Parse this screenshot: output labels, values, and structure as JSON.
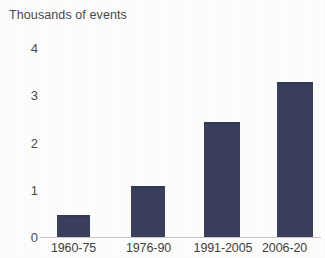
{
  "chart_data": {
    "type": "bar",
    "title": "Thousands of events",
    "xlabel": "",
    "ylabel": "Thousands of events",
    "categories": [
      "1960-75",
      "1976-90",
      "1991-2005",
      "2006-20"
    ],
    "values": [
      0.47,
      1.08,
      2.43,
      3.28
    ],
    "series": [
      {
        "name": "Events",
        "values": [
          0.47,
          1.08,
          2.43,
          3.28
        ]
      }
    ],
    "ylim": [
      0,
      4
    ],
    "y_ticks": [
      0,
      1,
      2,
      3,
      4
    ],
    "y_tick_labels": [
      "0",
      "1",
      "2",
      "3",
      "4"
    ],
    "grid": false,
    "legend": "none",
    "bar_color": "#3a3f5c",
    "axis_color": "#c9c9c9",
    "background_color": "#ffffff"
  },
  "axis": {
    "y_labels": [
      "4",
      "3",
      "2",
      "1",
      "0"
    ]
  }
}
